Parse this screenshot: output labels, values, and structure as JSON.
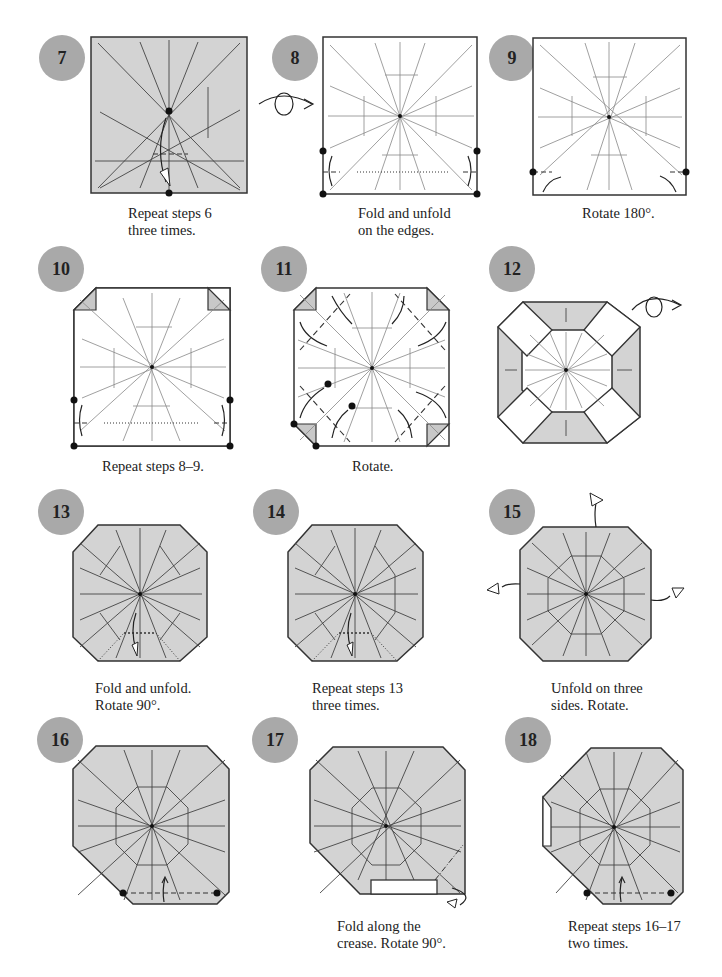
{
  "steps": [
    {
      "number": "7",
      "caption": "Repeat steps 6\nthree times."
    },
    {
      "number": "8",
      "caption": "Fold and unfold\non the edges."
    },
    {
      "number": "9",
      "caption": "Rotate 180°."
    },
    {
      "number": "10",
      "caption": "Repeat steps 8–9."
    },
    {
      "number": "11",
      "caption": "Rotate."
    },
    {
      "number": "12",
      "caption": ""
    },
    {
      "number": "13",
      "caption": "Fold and unfold.\nRotate 90°."
    },
    {
      "number": "14",
      "caption": "Repeat steps 13\nthree times."
    },
    {
      "number": "15",
      "caption": "Unfold on three\nsides. Rotate."
    },
    {
      "number": "16",
      "caption": ""
    },
    {
      "number": "17",
      "caption": "Fold along the\ncrease. Rotate 90°."
    },
    {
      "number": "18",
      "caption": "Repeat steps 16–17\ntwo times."
    }
  ],
  "colors": {
    "badge": "#a9a9a9",
    "paper_colored": "#d3d3d3",
    "paper_white": "#ffffff",
    "line": "#333333"
  }
}
